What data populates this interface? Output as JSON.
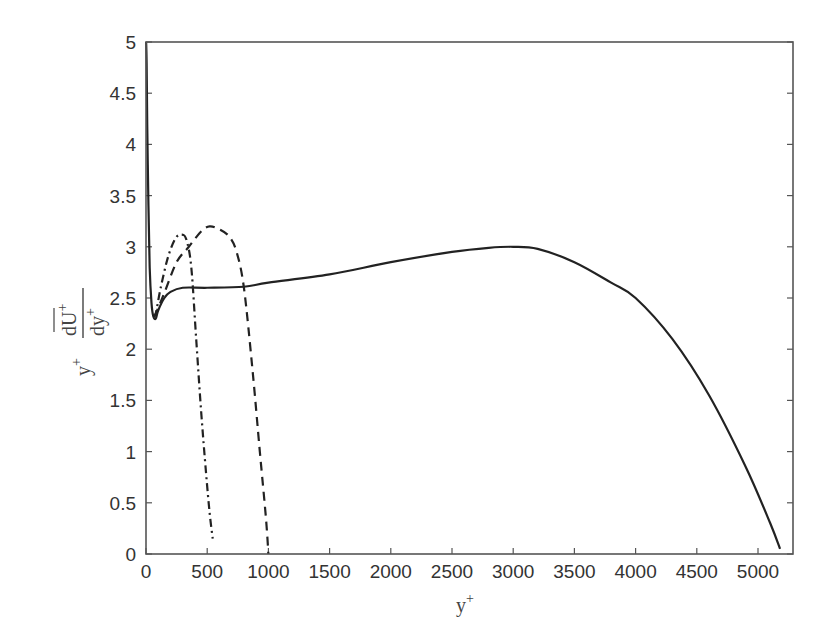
{
  "chart_data": {
    "type": "line",
    "title": "",
    "xlabel": "y+",
    "ylabel": "y+ dŪ+/dy+",
    "xlim": [
      0,
      5200
    ],
    "ylim": [
      0,
      5
    ],
    "grid": false,
    "legend": null,
    "x_ticks": [
      0,
      500,
      1000,
      1500,
      2000,
      2500,
      3000,
      3500,
      4000,
      4500,
      5000
    ],
    "y_ticks": [
      0,
      0.5,
      1,
      1.5,
      2,
      2.5,
      3,
      3.5,
      4,
      4.5,
      5
    ],
    "y_tick_labels": [
      "0",
      "0.5",
      "1",
      "1.5",
      "2",
      "2.5",
      "3",
      "3.5",
      "4",
      "4.5",
      "5"
    ],
    "series": [
      {
        "name": "solid",
        "style": "solid",
        "x": [
          1,
          5,
          10,
          20,
          30,
          45,
          60,
          80,
          100,
          150,
          200,
          300,
          500,
          800,
          1000,
          1500,
          2000,
          2500,
          2800,
          3000,
          3200,
          3500,
          3800,
          4000,
          4300,
          4600,
          4900,
          5100,
          5180
        ],
        "y": [
          5.0,
          4.8,
          4.2,
          3.4,
          2.8,
          2.45,
          2.32,
          2.3,
          2.38,
          2.5,
          2.56,
          2.6,
          2.6,
          2.61,
          2.65,
          2.73,
          2.85,
          2.95,
          2.99,
          3.0,
          2.98,
          2.85,
          2.65,
          2.5,
          2.1,
          1.55,
          0.85,
          0.3,
          0.05
        ]
      },
      {
        "name": "dash-dot",
        "style": "dashdot",
        "x": [
          60,
          80,
          120,
          180,
          240,
          290,
          330,
          370,
          410,
          450,
          490,
          520,
          545
        ],
        "y": [
          2.32,
          2.35,
          2.6,
          2.9,
          3.08,
          3.12,
          3.07,
          2.8,
          2.1,
          1.4,
          0.8,
          0.4,
          0.15
        ]
      },
      {
        "name": "dashed",
        "style": "dashed",
        "x": [
          60,
          80,
          150,
          250,
          350,
          450,
          520,
          600,
          680,
          740,
          800,
          870,
          930,
          980,
          1000
        ],
        "y": [
          2.32,
          2.35,
          2.55,
          2.85,
          3.0,
          3.15,
          3.2,
          3.17,
          3.1,
          2.95,
          2.6,
          1.8,
          1.0,
          0.35,
          0.0
        ]
      }
    ]
  },
  "axes": {
    "x_title_main": "y",
    "x_title_sup": "+",
    "y_title_prefix": "y",
    "y_title_prefix_sup": "+",
    "y_title_num": "dU",
    "y_title_num_sup": "+",
    "y_title_den": "dy",
    "y_title_den_sup": "+"
  }
}
